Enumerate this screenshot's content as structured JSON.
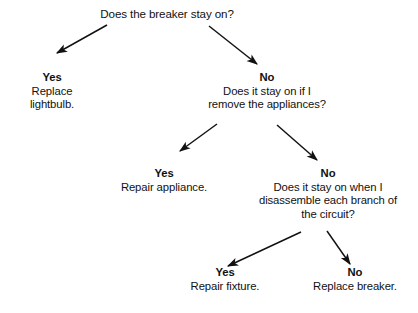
{
  "diagram": {
    "title": "Does the breaker stay on?",
    "type": "decision-tree",
    "ink_color": "#111111",
    "background_color": "#ffffff",
    "nodes": {
      "root": {
        "answer": "",
        "lines": [
          "Does the breaker stay on?"
        ]
      },
      "yes1": {
        "answer": "Yes",
        "lines": [
          "Replace",
          "lightbulb."
        ]
      },
      "no1": {
        "answer": "No",
        "lines": [
          "Does it stay on if I",
          "remove the appliances?"
        ]
      },
      "yes2": {
        "answer": "Yes",
        "lines": [
          "Repair appliance."
        ]
      },
      "no2": {
        "answer": "No",
        "lines": [
          "Does it stay on when I",
          "disassemble each branch of",
          "the circuit?"
        ]
      },
      "yes3": {
        "answer": "Yes",
        "lines": [
          "Repair fixture."
        ]
      },
      "no3": {
        "answer": "No",
        "lines": [
          "Replace breaker."
        ]
      }
    },
    "edges": [
      {
        "name": "root-to-yes1",
        "from": "root",
        "to": "yes1",
        "label": "Yes",
        "x1": 107,
        "y1": 25,
        "x2": 53,
        "y2": 56
      },
      {
        "name": "root-to-no1",
        "from": "root",
        "to": "no1",
        "label": "No",
        "x1": 209,
        "y1": 26,
        "x2": 261,
        "y2": 67
      },
      {
        "name": "no1-to-yes2",
        "from": "no1",
        "to": "yes2",
        "label": "Yes",
        "x1": 217,
        "y1": 124,
        "x2": 176,
        "y2": 154
      },
      {
        "name": "no1-to-no2",
        "from": "no1",
        "to": "no2",
        "label": "No",
        "x1": 277,
        "y1": 125,
        "x2": 321,
        "y2": 163
      },
      {
        "name": "no2-to-yes3",
        "from": "no2",
        "to": "yes3",
        "label": "Yes",
        "x1": 301,
        "y1": 232,
        "x2": 223,
        "y2": 268
      },
      {
        "name": "no2-to-no3",
        "from": "no2",
        "to": "no3",
        "label": "No",
        "x1": 327,
        "y1": 231,
        "x2": 352,
        "y2": 267
      }
    ]
  }
}
